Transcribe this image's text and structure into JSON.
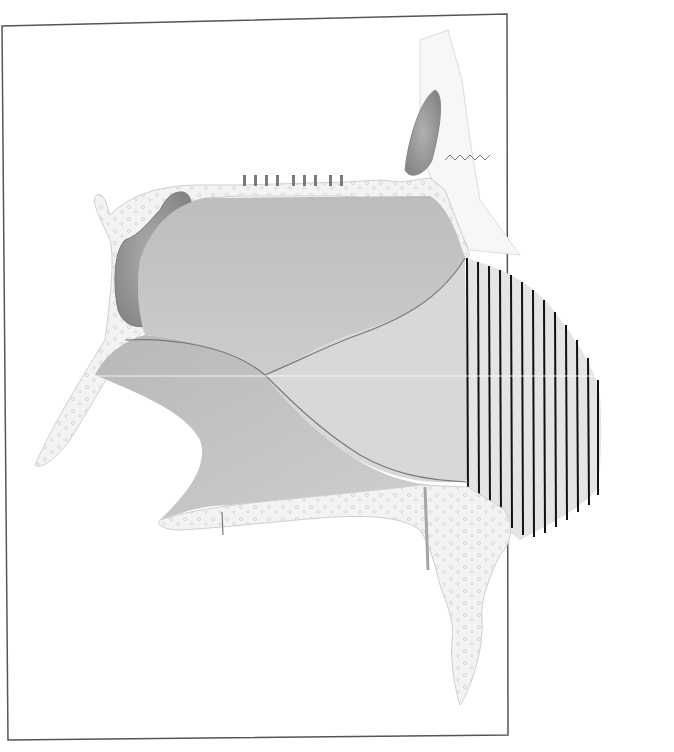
{
  "figure": {
    "type": "anatomical-illustration",
    "labels": [],
    "hatched_region": {
      "pattern": "vertical-lines",
      "line_count": 13,
      "line_color": "#111111"
    },
    "colors": {
      "frame": "#555555",
      "bone": "#f2f2f2",
      "bone_outline": "#c8c8c8",
      "cartilage_region": "#d9d9d9",
      "sinus_cavity": "#9a9a9a",
      "mucosa_lower": "#c4c4c4",
      "background": "#ffffff"
    }
  }
}
